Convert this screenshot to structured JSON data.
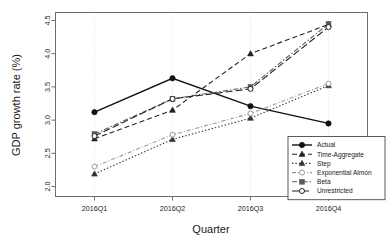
{
  "chart_data": {
    "type": "line",
    "title": "",
    "xlabel": "Quarter",
    "ylabel": "GDP growth rate (%)",
    "categories": [
      "2016Q1",
      "2016Q2",
      "2016Q3",
      "2016Q4"
    ],
    "ylim": [
      1.85,
      4.62
    ],
    "yticks": [
      "2.0",
      "2.5",
      "3.0",
      "3.5",
      "4.0",
      "4.5"
    ],
    "ytick_values": [
      2.0,
      2.5,
      3.0,
      3.5,
      4.0,
      4.5
    ],
    "grid": "vertical-dotted",
    "legend_position": "bottom-right",
    "series": [
      {
        "name": "Actual",
        "values": [
          3.12,
          3.63,
          3.21,
          2.95
        ],
        "style": "solid",
        "marker": "filled-circle",
        "color": "#111111"
      },
      {
        "name": "Time-Aggregate",
        "values": [
          2.72,
          3.15,
          4.0,
          4.44
        ],
        "style": "dashed",
        "marker": "filled-triangle",
        "color": "#222222"
      },
      {
        "name": "Step",
        "values": [
          2.19,
          2.71,
          3.03,
          3.52
        ],
        "style": "dotted",
        "marker": "filled-triangle",
        "color": "#333333"
      },
      {
        "name": "Exponential Almon",
        "values": [
          2.3,
          2.78,
          3.1,
          3.55
        ],
        "style": "dash-dot-light",
        "marker": "open-circle",
        "color": "#9a9a9a"
      },
      {
        "name": "Beta",
        "values": [
          2.79,
          3.32,
          3.5,
          4.45
        ],
        "style": "dash-dot",
        "marker": "filled-square",
        "color": "#5a5a5a"
      },
      {
        "name": "Unrestricted",
        "values": [
          2.76,
          3.32,
          3.47,
          4.4
        ],
        "style": "long-dash",
        "marker": "open-circle",
        "color": "#222222"
      }
    ]
  },
  "legend": {
    "entries": [
      {
        "label": "Actual"
      },
      {
        "label": "Time-Aggregate"
      },
      {
        "label": "Step"
      },
      {
        "label": "Exponential Almon"
      },
      {
        "label": "Beta"
      },
      {
        "label": "Unrestricted"
      }
    ]
  },
  "axes": {
    "y_title": "GDP growth rate (%)",
    "x_title": "Quarter"
  }
}
